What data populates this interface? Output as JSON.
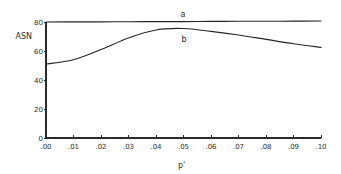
{
  "chart_data": {
    "type": "line",
    "title": "",
    "xlabel": "p'",
    "ylabel": "ASN",
    "xlim": [
      0.0,
      0.1
    ],
    "ylim": [
      0,
      80
    ],
    "grid": false,
    "legend": "none (curves labeled inline)",
    "x": [
      0.0,
      0.01,
      0.02,
      0.03,
      0.04,
      0.05,
      0.06,
      0.07,
      0.08,
      0.09,
      0.1
    ],
    "x_tick_labels": [
      ".00",
      ".01",
      ".02",
      ".03",
      ".04",
      ".05",
      ".06",
      ".07",
      ".08",
      ".09",
      ".10"
    ],
    "y_ticks": [
      0,
      20,
      40,
      60,
      80
    ],
    "y_tick_labels": [
      "0",
      "20",
      "40",
      "60",
      "80"
    ],
    "series": [
      {
        "name": "a",
        "label": "a",
        "values": [
          80.0,
          80.1,
          80.1,
          80.2,
          80.3,
          80.3,
          80.4,
          80.5,
          80.5,
          80.6,
          80.7
        ]
      },
      {
        "name": "b",
        "label": "b",
        "values": [
          51.0,
          54.0,
          61.0,
          69.0,
          74.5,
          75.5,
          73.5,
          71.0,
          68.0,
          65.0,
          62.5
        ]
      }
    ]
  }
}
